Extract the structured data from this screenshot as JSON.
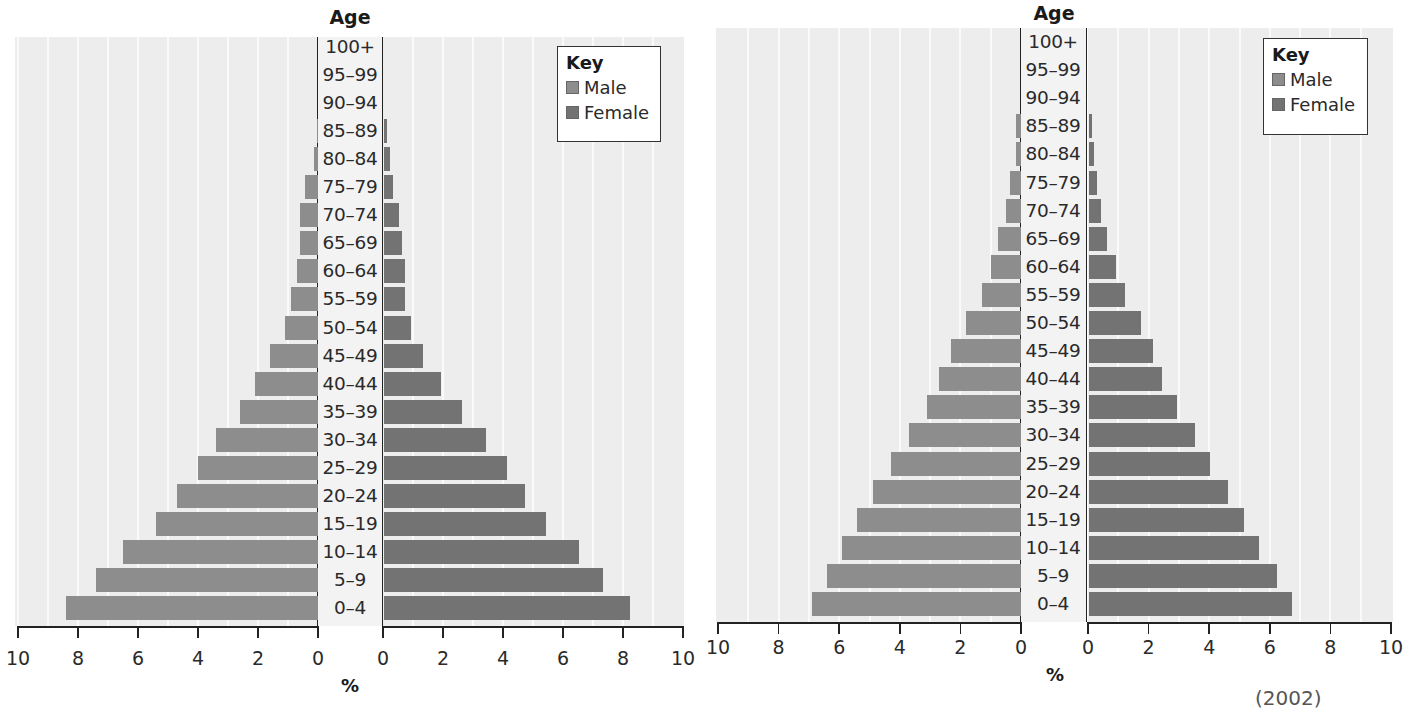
{
  "chart_data": [
    {
      "type": "bar",
      "subtype": "population-pyramid",
      "title": "",
      "ylabel": "Age",
      "xlabel": "%",
      "x_ticks_male": [
        "10",
        "8",
        "6",
        "4",
        "2",
        "0"
      ],
      "x_ticks_female": [
        "0",
        "2",
        "4",
        "6",
        "8",
        "10"
      ],
      "xlim": [
        0,
        10
      ],
      "grid": true,
      "legend_position": "top-right",
      "legend": {
        "title": "Key",
        "entries": [
          "Male",
          "Female"
        ]
      },
      "categories": [
        "100+",
        "95–99",
        "90–94",
        "85–89",
        "80–84",
        "75–79",
        "70–74",
        "65–69",
        "60–64",
        "55–59",
        "50–54",
        "45–49",
        "40–44",
        "35–39",
        "30–34",
        "25–29",
        "20–24",
        "15–19",
        "10–14",
        "5–9",
        "0–4"
      ],
      "series": [
        {
          "name": "Male",
          "color": "#8d8d8d",
          "values": [
            0,
            0,
            0,
            0.05,
            0.15,
            0.45,
            0.6,
            0.6,
            0.7,
            0.9,
            1.1,
            1.6,
            2.1,
            2.6,
            3.4,
            4.0,
            4.7,
            5.4,
            6.5,
            7.4,
            8.4
          ]
        },
        {
          "name": "Female",
          "color": "#737373",
          "values": [
            0,
            0,
            0,
            0.1,
            0.2,
            0.3,
            0.5,
            0.6,
            0.7,
            0.7,
            0.9,
            1.3,
            1.9,
            2.6,
            3.4,
            4.1,
            4.7,
            5.4,
            6.5,
            7.3,
            8.2
          ]
        }
      ]
    },
    {
      "type": "bar",
      "subtype": "population-pyramid",
      "title": "",
      "ylabel": "Age",
      "xlabel": "%",
      "x_ticks_male": [
        "10",
        "8",
        "6",
        "4",
        "2",
        "0"
      ],
      "x_ticks_female": [
        "0",
        "2",
        "4",
        "6",
        "8",
        "10"
      ],
      "xlim": [
        0,
        10
      ],
      "grid": true,
      "legend_position": "top-right",
      "legend": {
        "title": "Key",
        "entries": [
          "Male",
          "Female"
        ]
      },
      "categories": [
        "100+",
        "95–99",
        "90–94",
        "85–89",
        "80–84",
        "75–79",
        "70–74",
        "65–69",
        "60–64",
        "55–59",
        "50–54",
        "45–49",
        "40–44",
        "35–39",
        "30–34",
        "25–29",
        "20–24",
        "15–19",
        "10–14",
        "5–9",
        "0–4"
      ],
      "series": [
        {
          "name": "Male",
          "color": "#8d8d8d",
          "values": [
            0,
            0,
            0,
            0.15,
            0.15,
            0.35,
            0.5,
            0.75,
            1.0,
            1.3,
            1.8,
            2.3,
            2.7,
            3.1,
            3.7,
            4.3,
            4.9,
            5.4,
            5.9,
            6.4,
            6.9
          ]
        },
        {
          "name": "Female",
          "color": "#737373",
          "values": [
            0,
            0,
            0,
            0.1,
            0.15,
            0.25,
            0.4,
            0.6,
            0.9,
            1.2,
            1.7,
            2.1,
            2.4,
            2.9,
            3.5,
            4.0,
            4.6,
            5.1,
            5.6,
            6.2,
            6.7
          ]
        }
      ]
    }
  ],
  "charts": [
    {
      "age_title": "Age",
      "pct_label": "%",
      "legend_title": "Key",
      "legend_male": "Male",
      "legend_female": "Female"
    },
    {
      "age_title": "Age",
      "pct_label": "%",
      "legend_title": "Key",
      "legend_male": "Male",
      "legend_female": "Female"
    }
  ],
  "footnote": "(2002)"
}
